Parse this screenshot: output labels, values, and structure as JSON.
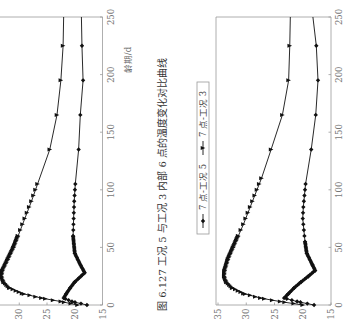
{
  "page": {
    "orientation": "rotated 90° counter-clockwise",
    "caption_top": "图 6.127   工况 5 与工况 3 内部 6 点的温度变化对比曲线",
    "xlabel": "龄期/d"
  },
  "chart_data": [
    {
      "type": "line",
      "title": "图 6.127 工况 5 与工况 3 内部 6 点的温度变化对比曲线",
      "xlabel": "龄期/d",
      "ylabel": "温度/℃",
      "xlim": [
        0,
        250
      ],
      "ylim": [
        15,
        35
      ],
      "x_ticks": [
        0,
        50,
        100,
        150,
        200,
        250
      ],
      "y_ticks_visible": [
        15,
        20,
        25,
        30
      ],
      "grid": false,
      "note": "chart partially cut off at image edge; legend not visible",
      "series": [
        {
          "name": "6 点-工况 5",
          "marker": "diamond",
          "x": [
            0,
            3,
            6,
            10,
            15,
            20,
            28,
            35,
            45,
            60,
            75,
            90,
            105,
            135,
            165,
            195,
            225,
            250
          ],
          "y": [
            17.8,
            20.5,
            22.0,
            21.5,
            20.8,
            20.0,
            18.2,
            19.0,
            20.0,
            20.3,
            20.2,
            20.1,
            19.9,
            19.3,
            19.0,
            18.5,
            18.7,
            18.8
          ]
        },
        {
          "name": "6 点-工况 3",
          "marker": "triangle",
          "x": [
            0,
            3,
            6,
            10,
            15,
            20,
            25,
            30,
            40,
            50,
            60,
            75,
            90,
            105,
            135,
            165,
            195,
            225,
            250
          ],
          "y": [
            19.5,
            22.5,
            26.0,
            29.5,
            31.8,
            32.8,
            33.2,
            33.0,
            32.0,
            31.0,
            30.2,
            29.0,
            27.8,
            26.7,
            24.5,
            23.2,
            22.5,
            22.1,
            22.0
          ]
        }
      ]
    },
    {
      "type": "line",
      "title": "",
      "xlabel": "",
      "ylabel": "",
      "xlim": [
        0,
        250
      ],
      "ylim": [
        15,
        35
      ],
      "x_ticks": [
        0,
        50,
        100,
        150,
        200,
        250
      ],
      "y_ticks": [
        15,
        20,
        25,
        30,
        35
      ],
      "grid": false,
      "legend_position": "top (rotated: left side)",
      "series": [
        {
          "name": "7 点-工况 5",
          "marker": "diamond",
          "x": [
            0,
            3,
            6,
            10,
            15,
            20,
            25,
            30,
            35,
            45,
            55,
            65,
            75,
            85,
            95,
            105,
            135,
            165,
            195,
            225,
            250
          ],
          "y": [
            18.0,
            21.0,
            23.3,
            22.5,
            21.5,
            20.3,
            19.0,
            17.8,
            18.3,
            19.3,
            19.6,
            19.8,
            20.0,
            19.9,
            19.7,
            19.5,
            18.5,
            17.7,
            17.3,
            17.6,
            18.2
          ]
        },
        {
          "name": "7 点-工况 3",
          "marker": "triangle",
          "x": [
            0,
            3,
            6,
            10,
            15,
            20,
            25,
            30,
            40,
            50,
            60,
            70,
            80,
            90,
            100,
            110,
            135,
            165,
            195,
            225,
            250
          ],
          "y": [
            20.0,
            24.0,
            27.5,
            30.5,
            32.5,
            33.5,
            33.9,
            33.8,
            33.2,
            32.3,
            31.4,
            30.5,
            29.7,
            28.9,
            28.1,
            27.3,
            25.6,
            23.6,
            22.5,
            22.3,
            22.2
          ]
        }
      ]
    }
  ],
  "legend": {
    "items": [
      {
        "label": "7 点-工况 5",
        "marker": "diamond"
      },
      {
        "label": "7 点-工况 3",
        "marker": "triangle"
      }
    ]
  },
  "colors": {
    "curve": "#111111",
    "axis": "#9a9a9a",
    "text": "#333333"
  }
}
